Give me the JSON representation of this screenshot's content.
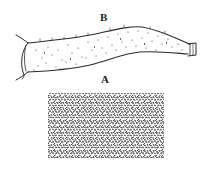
{
  "figure": {
    "type": "scientific illustration",
    "labels": {
      "upper": "B",
      "lower": "A"
    },
    "parts": [
      {
        "name": "elongated-tube",
        "description": "Stippled, slightly curved tubular specimen with flared left opening and small capped right end"
      },
      {
        "name": "texture-sample",
        "description": "Rectangular patch of densely hatched surface texture"
      }
    ],
    "colors": {
      "ink": "#2a2a2a",
      "background": "#ffffff"
    }
  }
}
